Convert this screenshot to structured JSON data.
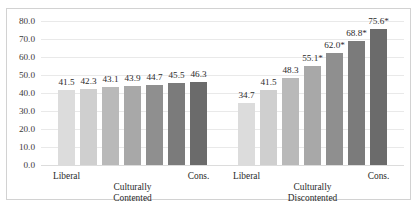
{
  "chart_data": {
    "type": "bar",
    "title": "",
    "subtitle": "",
    "xlabel": "",
    "ylabel": "",
    "ylim": [
      0.0,
      80.0
    ],
    "ytick_step": 10.0,
    "yticks": [
      "80.0",
      "70.0",
      "60.0",
      "50.0",
      "40.0",
      "30.0",
      "20.0",
      "10.0",
      "0.0"
    ],
    "grid": true,
    "legend": "none",
    "groups": [
      {
        "name": "Culturally Contented",
        "left_label": "Liberal",
        "right_label": "Cons.",
        "center_label_line1": "Culturally",
        "center_label_line2": "Contented",
        "values": [
          41.5,
          42.3,
          43.1,
          43.9,
          44.7,
          45.5,
          46.3
        ],
        "data_labels": [
          "41.5",
          "42.3",
          "43.1",
          "43.9",
          "44.7",
          "45.5",
          "46.3"
        ]
      },
      {
        "name": "Culturally Discontented",
        "left_label": "Liberal",
        "right_label": "Cons.",
        "center_label_line1": "Culturally",
        "center_label_line2": "Discontented",
        "values": [
          34.7,
          41.5,
          48.3,
          55.1,
          62.0,
          68.8,
          75.6
        ],
        "data_labels": [
          "34.7",
          "41.5",
          "48.3",
          "55.1*",
          "62.0*",
          "68.8*",
          "75.6*"
        ]
      }
    ],
    "bar_colors": [
      "#dcdcdc",
      "#cfcfcf",
      "#b9b9b9",
      "#a8a8a8",
      "#8f8f8f",
      "#7b7b7b",
      "#6b6b6b"
    ],
    "gridline_color": "#e9e9e9",
    "frame_color": "#d2d2d2",
    "background_color": "#ffffff"
  }
}
